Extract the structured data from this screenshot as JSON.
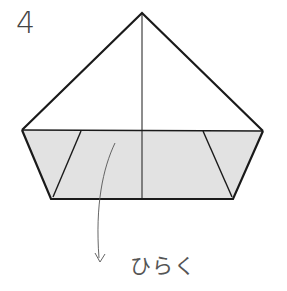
{
  "step": {
    "number": "4"
  },
  "instruction": {
    "label": "ひらく"
  },
  "colors": {
    "line": "#1a1a1a",
    "fill": "#e2e2e2",
    "arrow": "#555555",
    "text": "#444444"
  },
  "shape": {
    "apex": [
      142,
      13
    ],
    "left_corner": [
      22,
      130
    ],
    "right_corner": [
      263,
      131
    ],
    "bottom_left": [
      51,
      199
    ],
    "bottom_right": [
      233,
      199
    ],
    "inner_left": [
      [
        81,
        131
      ],
      [
        53,
        197
      ]
    ],
    "inner_right": [
      [
        203,
        131
      ],
      [
        232,
        197
      ]
    ],
    "center_line": [
      [
        142,
        13
      ],
      [
        142,
        199
      ]
    ]
  }
}
